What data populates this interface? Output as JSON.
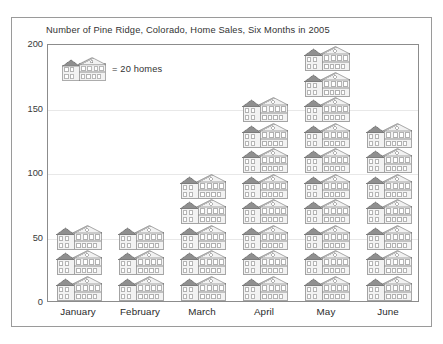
{
  "chart_data": {
    "type": "bar",
    "pictograph": true,
    "title": "Number of Pine Ridge, Colorado, Home Sales, Six Months in 2005",
    "xlabel": "",
    "ylabel": "",
    "categories": [
      "January",
      "February",
      "March",
      "April",
      "May",
      "June"
    ],
    "values": [
      60,
      60,
      100,
      160,
      200,
      140
    ],
    "icon_counts": [
      3,
      3,
      5,
      8,
      10,
      7
    ],
    "icon_unit_value": 20,
    "icon_name": "house-icon",
    "ylim": [
      0,
      200
    ],
    "y_ticks": [
      0,
      50,
      100,
      150,
      200
    ],
    "y_tick_labels": [
      "0",
      "50",
      "100",
      "150",
      "200"
    ],
    "grid": true,
    "legend": {
      "position": "inside-top-left",
      "symbol": "house-icon",
      "label": "= 20 homes"
    },
    "colors": {
      "icon_fill": "#f2f2f2",
      "icon_roof": "#8f8f8f",
      "icon_stroke": "#6e6e6e",
      "gridline": "#e8e8e8",
      "frame": "#8c8c8c",
      "text": "#333333",
      "background": "#ffffff"
    }
  },
  "legend": {
    "label": "= 20 homes"
  },
  "axis": {
    "y_labels": [
      "200",
      "150",
      "100",
      "50",
      "0"
    ],
    "x_labels": [
      "January",
      "February",
      "March",
      "April",
      "May",
      "June"
    ]
  }
}
